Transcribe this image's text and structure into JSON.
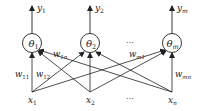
{
  "diagram": {
    "type": "single-layer-neural-network",
    "colors": {
      "stroke": "#222222",
      "background": "#ffffff"
    },
    "outputs": [
      {
        "id": "y1",
        "base": "y",
        "sub": "1"
      },
      {
        "id": "y2",
        "base": "y",
        "sub": "2"
      },
      {
        "id": "ym",
        "base": "y",
        "sub": "m"
      }
    ],
    "neurons": [
      {
        "id": "theta1",
        "base": "θ",
        "sub": "1"
      },
      {
        "id": "theta2",
        "base": "θ",
        "sub": "2"
      },
      {
        "id": "thetam",
        "base": "θ",
        "sub": "m"
      }
    ],
    "inputs": [
      {
        "id": "x1",
        "base": "x",
        "sub": "1"
      },
      {
        "id": "x2",
        "base": "x",
        "sub": "2"
      },
      {
        "id": "xn",
        "base": "x",
        "sub": "n"
      }
    ],
    "weights": [
      {
        "id": "w11",
        "base": "w",
        "sub": "11"
      },
      {
        "id": "w12",
        "base": "w",
        "sub": "12"
      },
      {
        "id": "w1n",
        "base": "w",
        "sub": "1n"
      },
      {
        "id": "wm1",
        "base": "w",
        "sub": "m1"
      },
      {
        "id": "wmn",
        "base": "w",
        "sub": "mn"
      }
    ],
    "ellipsis": "⋯"
  }
}
